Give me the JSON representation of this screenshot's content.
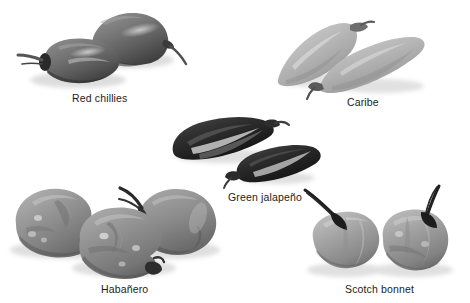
{
  "figure": {
    "background_color": "#ffffff",
    "caption_color": "#1c1c1c",
    "groups": [
      {
        "id": "red-chillies",
        "label": "Red chillies",
        "label_x": 72,
        "label_y": 92,
        "count": 2,
        "body_color": "#6f6f6f",
        "shade_color": "#3a3a3a",
        "stem_color": "#4a4a4a",
        "description": "two plump blunt-tipped chillies, stems pointing left and right"
      },
      {
        "id": "caribe",
        "label": "Caribe",
        "label_x": 347,
        "label_y": 96,
        "count": 2,
        "body_color": "#b4b4b4",
        "shade_color": "#8e8e8e",
        "stem_color": "#707070",
        "description": "two pale elongated tapering cone peppers"
      },
      {
        "id": "green-jalapeno",
        "label": "Green jalapeño",
        "label_x": 228,
        "label_y": 191,
        "count": 2,
        "body_color": "#2a2a2a",
        "shade_color": "#111111",
        "stem_color": "#3c3c3c",
        "description": "two very dark glossy curved jalapenos with bright highlights"
      },
      {
        "id": "habanero",
        "label": "Habañero",
        "label_x": 101,
        "label_y": 283,
        "count": 3,
        "body_color": "#8c8c8c",
        "shade_color": "#6a6a6a",
        "stem_color": "#2f2f2f",
        "description": "three lumpy wrinkled lantern-shaped habaneros"
      },
      {
        "id": "scotch-bonnet",
        "label": "Scotch bonnet",
        "label_x": 345,
        "label_y": 283,
        "count": 2,
        "body_color": "#9a9a9a",
        "shade_color": "#787878",
        "stem_color": "#1f1f1f",
        "description": "two squat rounded bonnets with long curved dark stems"
      }
    ]
  }
}
